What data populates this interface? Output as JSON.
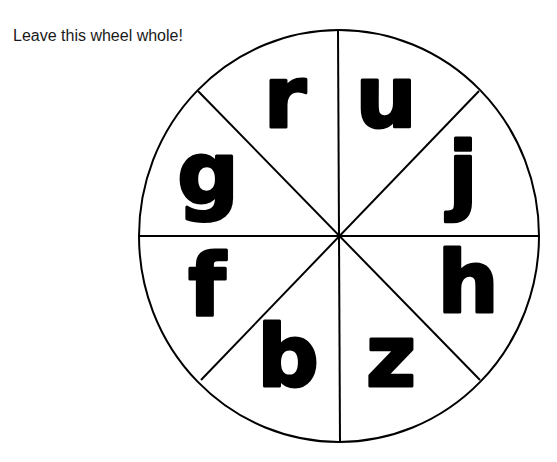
{
  "caption": "Leave this wheel whole!",
  "wheel": {
    "center": [
      339,
      236
    ],
    "radius_x": 200,
    "radius_y": 206,
    "segments": 8,
    "line_color": "#000000",
    "letters": [
      {
        "char": "r",
        "x": 285,
        "y": 127
      },
      {
        "char": "u",
        "x": 386,
        "y": 127
      },
      {
        "char": "j",
        "x": 463,
        "y": 203
      },
      {
        "char": "g",
        "x": 208,
        "y": 203
      },
      {
        "char": "f",
        "x": 207,
        "y": 315
      },
      {
        "char": "h",
        "x": 468,
        "y": 312
      },
      {
        "char": "b",
        "x": 288,
        "y": 386
      },
      {
        "char": "z",
        "x": 391,
        "y": 386
      }
    ]
  }
}
